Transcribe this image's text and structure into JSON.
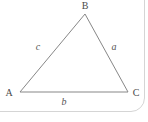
{
  "diagram": {
    "type": "triangle",
    "vertices": [
      {
        "label": "A",
        "x": 20,
        "y": 92
      },
      {
        "label": "B",
        "x": 85,
        "y": 14
      },
      {
        "label": "C",
        "x": 128,
        "y": 92
      }
    ],
    "side_labels": {
      "a": {
        "label": "a",
        "between": "B-C"
      },
      "b": {
        "label": "b",
        "between": "A-C"
      },
      "c": {
        "label": "c",
        "between": "A-B"
      }
    },
    "colors": {
      "line": "#878787",
      "label": "#4a4a4a",
      "card_border": "#d5d5d5",
      "background": "#ffffff"
    }
  }
}
